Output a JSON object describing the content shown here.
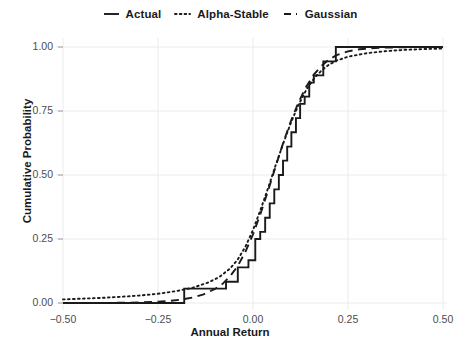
{
  "chart_data": {
    "type": "line",
    "title": "",
    "xlabel": "Annual Return",
    "ylabel": "Cumulative Probability",
    "xlim": [
      -0.5,
      0.5
    ],
    "ylim": [
      0.0,
      1.0
    ],
    "xticks": [
      -0.5,
      -0.25,
      0.0,
      0.25,
      0.5
    ],
    "xticklabels": [
      "-0.50",
      "-0.25",
      "0.00",
      "0.25",
      "0.50"
    ],
    "yticks": [
      0.0,
      0.25,
      0.5,
      0.75,
      1.0
    ],
    "yticklabels": [
      "0.00",
      "0.25",
      "0.50",
      "0.75",
      "1.00"
    ],
    "grid": true,
    "legend_position": "top-center",
    "series": [
      {
        "name": "Actual",
        "style": "solid",
        "drawstyle": "steps-post",
        "color": "#1a1a1a",
        "x": [
          -0.5,
          -0.181,
          -0.181,
          -0.071,
          -0.071,
          -0.04,
          -0.04,
          -0.012,
          -0.012,
          0.006,
          0.006,
          0.019,
          0.019,
          0.032,
          0.032,
          0.044,
          0.044,
          0.056,
          0.056,
          0.068,
          0.068,
          0.079,
          0.079,
          0.09,
          0.09,
          0.101,
          0.101,
          0.113,
          0.113,
          0.124,
          0.124,
          0.136,
          0.136,
          0.148,
          0.148,
          0.16,
          0.16,
          0.185,
          0.185,
          0.218,
          0.218,
          0.5
        ],
        "y": [
          0.0,
          0.0,
          0.056,
          0.056,
          0.083,
          0.083,
          0.139,
          0.139,
          0.167,
          0.167,
          0.25,
          0.25,
          0.278,
          0.278,
          0.333,
          0.333,
          0.389,
          0.389,
          0.444,
          0.444,
          0.5,
          0.5,
          0.556,
          0.556,
          0.611,
          0.611,
          0.667,
          0.667,
          0.722,
          0.722,
          0.778,
          0.778,
          0.806,
          0.806,
          0.861,
          0.861,
          0.889,
          0.889,
          0.944,
          0.944,
          1.0,
          1.0
        ]
      },
      {
        "name": "Alpha-Stable",
        "style": "dotted",
        "drawstyle": "default",
        "color": "#1a1a1a",
        "x": [
          -0.5,
          -0.45,
          -0.4,
          -0.35,
          -0.3,
          -0.25,
          -0.2,
          -0.16,
          -0.12,
          -0.09,
          -0.06,
          -0.04,
          -0.02,
          0.0,
          0.02,
          0.04,
          0.06,
          0.08,
          0.1,
          0.12,
          0.14,
          0.16,
          0.18,
          0.2,
          0.22,
          0.25,
          0.3,
          0.35,
          0.4,
          0.45,
          0.5
        ],
        "y": [
          0.014,
          0.017,
          0.02,
          0.024,
          0.029,
          0.036,
          0.047,
          0.059,
          0.079,
          0.1,
          0.135,
          0.17,
          0.22,
          0.285,
          0.365,
          0.45,
          0.54,
          0.625,
          0.705,
          0.775,
          0.832,
          0.876,
          0.908,
          0.931,
          0.947,
          0.962,
          0.976,
          0.984,
          0.989,
          0.992,
          0.994
        ]
      },
      {
        "name": "Gaussian",
        "style": "dashed",
        "drawstyle": "default",
        "color": "#1a1a1a",
        "x": [
          -0.5,
          -0.45,
          -0.4,
          -0.35,
          -0.3,
          -0.25,
          -0.22,
          -0.19,
          -0.16,
          -0.13,
          -0.1,
          -0.08,
          -0.06,
          -0.04,
          -0.02,
          0.0,
          0.02,
          0.04,
          0.06,
          0.08,
          0.1,
          0.12,
          0.14,
          0.16,
          0.18,
          0.2,
          0.22,
          0.25,
          0.28,
          0.32,
          0.36,
          0.4,
          0.45,
          0.5
        ],
        "y": [
          0.0,
          0.0,
          0.0,
          0.001,
          0.002,
          0.005,
          0.008,
          0.013,
          0.021,
          0.034,
          0.055,
          0.075,
          0.105,
          0.145,
          0.2,
          0.268,
          0.35,
          0.44,
          0.535,
          0.628,
          0.712,
          0.785,
          0.845,
          0.892,
          0.926,
          0.951,
          0.968,
          0.983,
          0.991,
          0.996,
          0.998,
          0.999,
          1.0,
          1.0
        ]
      }
    ]
  },
  "legend": {
    "items": [
      {
        "label": "Actual",
        "key": "solid-line-key"
      },
      {
        "label": "Alpha-Stable",
        "key": "dotted-line-key"
      },
      {
        "label": "Gaussian",
        "key": "dashed-line-key"
      }
    ]
  }
}
